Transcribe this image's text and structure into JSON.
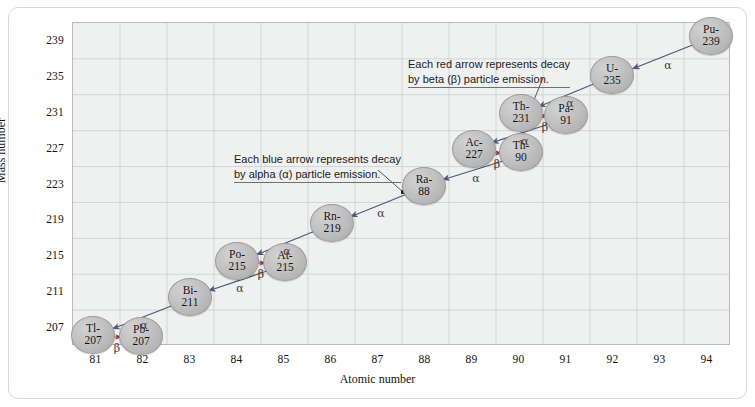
{
  "figure": {
    "frame_color": "#d9d9d9",
    "plot_bg": "#eff0f0",
    "grid_color": "#d2d4d6",
    "node_fill": "#c0c0c0",
    "alpha_arrow_color": "#4a5a78",
    "beta_arrow_color": "#8a3b3b"
  },
  "axes": {
    "x_title": "Atomic number",
    "y_title": "Mass number",
    "x_ticks": [
      "81",
      "82",
      "83",
      "84",
      "85",
      "86",
      "87",
      "88",
      "89",
      "90",
      "91",
      "92",
      "93",
      "94"
    ],
    "y_ticks": [
      "207",
      "211",
      "215",
      "219",
      "223",
      "227",
      "231",
      "235",
      "239"
    ],
    "x_min": 80.5,
    "x_max": 94.5,
    "y_min": 205,
    "y_max": 241
  },
  "callouts": [
    {
      "name": "alpha-callout",
      "line1": "Each blue arrow represents decay",
      "line2": "by alpha (α) particle emission.",
      "x": 234,
      "y": 152
    },
    {
      "name": "beta-callout",
      "line1": "Each red arrow represents decay",
      "line2": "by beta (β) particle emission.",
      "x": 408,
      "y": 57
    }
  ],
  "chart_data": {
    "type": "scatter",
    "xlabel": "Atomic number",
    "ylabel": "Mass number",
    "xlim": [
      80.5,
      94.5
    ],
    "ylim": [
      205,
      241
    ],
    "grid": true,
    "nodes": [
      {
        "id": "Pu-239",
        "sym": "Pu-",
        "num": "239",
        "z": 94,
        "a": 239,
        "px": 711,
        "py": 36
      },
      {
        "id": "U-235",
        "sym": "U-",
        "num": "235",
        "z": 92,
        "a": 235,
        "px": 612,
        "py": 75
      },
      {
        "id": "Th-231",
        "sym": "Th-",
        "num": "231",
        "z": 90,
        "a": 231,
        "px": 521,
        "py": 113
      },
      {
        "id": "Pa-91",
        "sym": "Pa-",
        "num": "91",
        "z": 91,
        "a": 231,
        "px": 566,
        "py": 115
      },
      {
        "id": "Ac-227",
        "sym": "Ac-",
        "num": "227",
        "z": 89,
        "a": 227,
        "px": 474,
        "py": 149
      },
      {
        "id": "Th-90",
        "sym": "Th-",
        "num": "90",
        "z": 90,
        "a": 227,
        "px": 521,
        "py": 152
      },
      {
        "id": "Ra-88",
        "sym": "Ra-",
        "num": "88",
        "z": 88,
        "a": 223,
        "px": 424,
        "py": 186
      },
      {
        "id": "Rn-219",
        "sym": "Rn-",
        "num": "219",
        "z": 86,
        "a": 219,
        "px": 332,
        "py": 223
      },
      {
        "id": "Po-215",
        "sym": "Po-",
        "num": "215",
        "z": 84,
        "a": 215,
        "px": 237,
        "py": 261
      },
      {
        "id": "At-215",
        "sym": "At-",
        "num": "215",
        "z": 85,
        "a": 215,
        "px": 285,
        "py": 262
      },
      {
        "id": "Bi-211",
        "sym": "Bi-",
        "num": "211",
        "z": 83,
        "a": 211,
        "px": 190,
        "py": 297
      },
      {
        "id": "Tl-207",
        "sym": "Tl-",
        "num": "207",
        "z": 81,
        "a": 207,
        "px": 93,
        "py": 335
      },
      {
        "id": "Pb-207",
        "sym": "Pb-",
        "num": "207",
        "z": 82,
        "a": 207,
        "px": 141,
        "py": 336
      }
    ],
    "arrows": [
      {
        "from": "Pu-239",
        "to": "U-235",
        "type": "alpha",
        "label": "α",
        "x1": 695,
        "y1": 44,
        "x2": 632,
        "y2": 69,
        "lx": 668,
        "ly": 65
      },
      {
        "from": "U-235",
        "to": "Th-231",
        "type": "alpha",
        "label": "α",
        "x1": 596,
        "y1": 83,
        "x2": 538,
        "y2": 107,
        "lx": 570,
        "ly": 103
      },
      {
        "from": "Th-231",
        "to": "Pa-91",
        "type": "beta",
        "label": "β",
        "x1": 540,
        "y1": 116,
        "x2": 548,
        "y2": 116,
        "lx": 545,
        "ly": 127
      },
      {
        "from": "Pa-91",
        "to": "Ac-227",
        "type": "alpha",
        "label": "α",
        "x1": 549,
        "y1": 124,
        "x2": 491,
        "y2": 143,
        "lx": 525,
        "ly": 141
      },
      {
        "from": "Ac-227",
        "to": "Th-90",
        "type": "beta",
        "label": "β",
        "x1": 492,
        "y1": 153,
        "x2": 502,
        "y2": 153,
        "lx": 497,
        "ly": 164
      },
      {
        "from": "Th-90",
        "to": "Ra-88",
        "type": "alpha",
        "label": "α",
        "x1": 503,
        "y1": 161,
        "x2": 442,
        "y2": 180,
        "lx": 476,
        "ly": 178
      },
      {
        "from": "Ra-88",
        "to": "Rn-219",
        "type": "alpha",
        "label": "α",
        "x1": 407,
        "y1": 194,
        "x2": 350,
        "y2": 217,
        "lx": 381,
        "ly": 213
      },
      {
        "from": "Rn-219",
        "to": "Po-215",
        "type": "alpha",
        "label": "α",
        "x1": 315,
        "y1": 231,
        "x2": 256,
        "y2": 255,
        "lx": 287,
        "ly": 251
      },
      {
        "from": "Po-215",
        "to": "At-215",
        "type": "beta",
        "label": "β",
        "x1": 256,
        "y1": 263,
        "x2": 266,
        "y2": 263,
        "lx": 261,
        "ly": 274
      },
      {
        "from": "At-215",
        "to": "Bi-211",
        "type": "alpha",
        "label": "α",
        "x1": 267,
        "y1": 271,
        "x2": 208,
        "y2": 291,
        "lx": 240,
        "ly": 288
      },
      {
        "from": "Bi-211",
        "to": "Tl-207",
        "type": "alpha",
        "label": "α",
        "x1": 174,
        "y1": 305,
        "x2": 112,
        "y2": 329,
        "lx": 144,
        "ly": 325
      },
      {
        "from": "Tl-207",
        "to": "Pb-207",
        "type": "beta",
        "label": "β",
        "x1": 112,
        "y1": 337,
        "x2": 122,
        "y2": 337,
        "lx": 117,
        "ly": 348
      }
    ],
    "leader_lines": [
      {
        "name": "alpha-leader",
        "x1": 378,
        "y1": 170,
        "x2": 403,
        "y2": 192,
        "dot_x": 403,
        "dot_y": 192
      },
      {
        "name": "beta-leader",
        "x1": 543,
        "y1": 78,
        "x2": 529,
        "y2": 112,
        "dot_x": 529,
        "dot_y": 112
      }
    ]
  }
}
